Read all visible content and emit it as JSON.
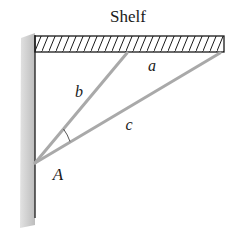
{
  "diagram": {
    "title": "Shelf",
    "labels": {
      "shelf": "Shelf",
      "side_a": "a",
      "side_b": "b",
      "side_c": "c",
      "vertex_A": "A"
    },
    "colors": {
      "strut": "#a9a9a9",
      "wall_fill": "#c8c8c8",
      "wall_edge": "#2a2a2a",
      "shelf_outline": "#1a1a1a",
      "hatch": "#1a1a1a",
      "text": "#1a1a1a"
    },
    "geometry": {
      "wall": {
        "x": 20,
        "y": 35,
        "width": 15,
        "height": 192
      },
      "shelf": {
        "x": 35,
        "y": 35,
        "width": 189,
        "height": 17
      },
      "point_A": [
        35,
        163
      ],
      "strut_b_end": [
        127,
        53
      ],
      "strut_c_end": [
        220,
        53
      ]
    }
  }
}
